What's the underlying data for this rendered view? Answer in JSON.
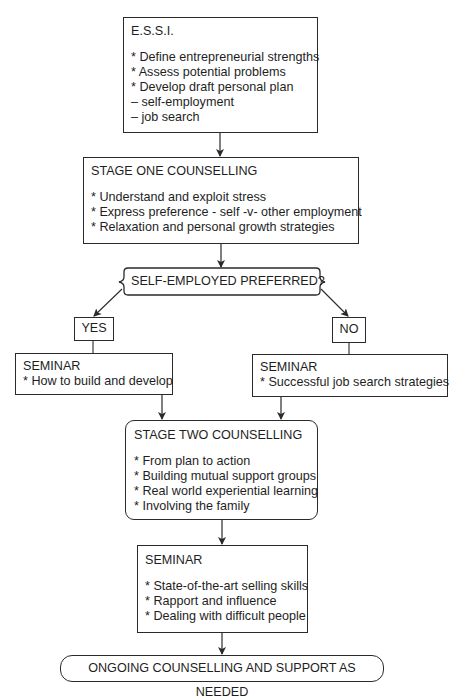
{
  "diagram": {
    "type": "flowchart",
    "nodes": {
      "essi": {
        "title": "E.S.S.I.",
        "items": [
          "* Define entrepreneurial strengths",
          "* Assess potential problems",
          "* Develop draft personal plan",
          "– self-employment",
          "– job search"
        ]
      },
      "stage_one": {
        "title": "STAGE ONE COUNSELLING",
        "items": [
          "* Understand and exploit stress",
          "* Express preference - self -v- other employment",
          "* Relaxation and personal growth strategies"
        ]
      },
      "decision": {
        "label": "SELF-EMPLOYED PREFERRED?"
      },
      "yes": {
        "label": "YES"
      },
      "no": {
        "label": "NO"
      },
      "seminar_yes": {
        "title": "SEMINAR",
        "items": [
          "* How to build and develop"
        ]
      },
      "seminar_no": {
        "title": "SEMINAR",
        "items": [
          "* Successful job search strategies"
        ]
      },
      "stage_two": {
        "title": "STAGE TWO COUNSELLING",
        "items": [
          "* From plan to action",
          "* Building mutual support groups",
          "* Real world experiential learning",
          "* Involving the family"
        ]
      },
      "seminar_final": {
        "title": "SEMINAR",
        "items": [
          "* State-of-the-art selling skills",
          "* Rapport and influence",
          "* Dealing with difficult people"
        ]
      },
      "ongoing": {
        "label": "ONGOING COUNSELLING AND SUPPORT AS NEEDED"
      }
    },
    "edges": [
      [
        "essi",
        "stage_one"
      ],
      [
        "stage_one",
        "decision"
      ],
      [
        "decision",
        "yes"
      ],
      [
        "decision",
        "no"
      ],
      [
        "yes",
        "seminar_yes"
      ],
      [
        "no",
        "seminar_no"
      ],
      [
        "seminar_yes",
        "stage_two"
      ],
      [
        "seminar_no",
        "stage_two"
      ],
      [
        "stage_two",
        "seminar_final"
      ],
      [
        "seminar_final",
        "ongoing"
      ]
    ],
    "colors": {
      "line": "#2a2a2a",
      "text": "#1e1e1e",
      "background": "#ffffff"
    }
  }
}
